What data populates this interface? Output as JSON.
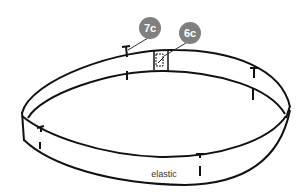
{
  "diagram": {
    "label": "elastic",
    "callouts": [
      {
        "id": "7c",
        "label": "7c",
        "color": "#808080"
      },
      {
        "id": "6c",
        "label": "6c",
        "color": "#808080"
      }
    ],
    "marks_count": 5
  }
}
